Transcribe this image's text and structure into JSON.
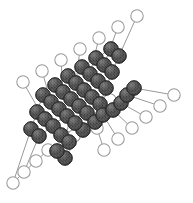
{
  "figure": {
    "type": "ball-and-stick-lattice",
    "width": 193,
    "height": 203,
    "background_color": "#ffffff",
    "atom_types": [
      {
        "id": "dark",
        "label": "filled-sphere-atom",
        "fill_color": "#474747",
        "stroke_color": "#2a2a2a",
        "radius": 7.2,
        "texture": "stippled"
      },
      {
        "id": "open",
        "label": "open-circle-atom",
        "fill_color": "#ffffff",
        "stroke_color": "#9a9a9a",
        "radius": 6.2,
        "texture": "none"
      }
    ],
    "bond_color": "#8d8d8d",
    "bond_width": 0.9
  },
  "chart_data": {
    "type": "scatter",
    "xlabel": "",
    "ylabel": "",
    "xlim": [
      0,
      193
    ],
    "ylim": [
      0,
      203
    ],
    "grid": false,
    "legend": "none",
    "series": [
      {
        "name": "dark",
        "points": [
          [
            111,
            49
          ],
          [
            119,
            56
          ],
          [
            96,
            58
          ],
          [
            104,
            65
          ],
          [
            112,
            72
          ],
          [
            82,
            67
          ],
          [
            90,
            74
          ],
          [
            98,
            81
          ],
          [
            106,
            88
          ],
          [
            68,
            76
          ],
          [
            76,
            83
          ],
          [
            84,
            90
          ],
          [
            92,
            97
          ],
          [
            100,
            104
          ],
          [
            55,
            85
          ],
          [
            63,
            92
          ],
          [
            71,
            99
          ],
          [
            79,
            106
          ],
          [
            87,
            113
          ],
          [
            43,
            95
          ],
          [
            51,
            102
          ],
          [
            59,
            109
          ],
          [
            67,
            116
          ],
          [
            37,
            112
          ],
          [
            45,
            119
          ],
          [
            53,
            126
          ],
          [
            31,
            129
          ],
          [
            39,
            136
          ],
          [
            61,
            135
          ],
          [
            69,
            142
          ],
          [
            83,
            130
          ],
          [
            75,
            123
          ],
          [
            95,
            122
          ],
          [
            103,
            115
          ],
          [
            113,
            110
          ],
          [
            121,
            103
          ],
          [
            127,
            95
          ],
          [
            134,
            88
          ],
          [
            65,
            158
          ],
          [
            57,
            151
          ]
        ]
      },
      {
        "name": "open",
        "points": [
          [
            137,
            16
          ],
          [
            118,
            27
          ],
          [
            99,
            38
          ],
          [
            80,
            49
          ],
          [
            61,
            60
          ],
          [
            42,
            71
          ],
          [
            23,
            82
          ],
          [
            174,
            95
          ],
          [
            160,
            106
          ],
          [
            146,
            117
          ],
          [
            132,
            128
          ],
          [
            118,
            139
          ],
          [
            104,
            150
          ],
          [
            85,
            118
          ],
          [
            97,
            128
          ],
          [
            62,
            126
          ],
          [
            74,
            136
          ],
          [
            48,
            150
          ],
          [
            36,
            161
          ],
          [
            24,
            172
          ],
          [
            13,
            183
          ],
          [
            110,
            100
          ]
        ]
      }
    ],
    "bonds": [
      [
        [
          137,
          16
        ],
        [
          119,
          56
        ]
      ],
      [
        [
          118,
          27
        ],
        [
          104,
          65
        ]
      ],
      [
        [
          99,
          38
        ],
        [
          90,
          74
        ]
      ],
      [
        [
          80,
          49
        ],
        [
          76,
          83
        ]
      ],
      [
        [
          61,
          60
        ],
        [
          63,
          92
        ]
      ],
      [
        [
          42,
          71
        ],
        [
          51,
          102
        ]
      ],
      [
        [
          23,
          82
        ],
        [
          39,
          110
        ]
      ],
      [
        [
          111,
          49
        ],
        [
          119,
          56
        ]
      ],
      [
        [
          96,
          58
        ],
        [
          104,
          65
        ]
      ],
      [
        [
          104,
          65
        ],
        [
          112,
          72
        ]
      ],
      [
        [
          82,
          67
        ],
        [
          90,
          74
        ]
      ],
      [
        [
          90,
          74
        ],
        [
          98,
          81
        ]
      ],
      [
        [
          98,
          81
        ],
        [
          106,
          88
        ]
      ],
      [
        [
          68,
          76
        ],
        [
          76,
          83
        ]
      ],
      [
        [
          76,
          83
        ],
        [
          84,
          90
        ]
      ],
      [
        [
          84,
          90
        ],
        [
          92,
          97
        ]
      ],
      [
        [
          92,
          97
        ],
        [
          100,
          104
        ]
      ],
      [
        [
          55,
          85
        ],
        [
          63,
          92
        ]
      ],
      [
        [
          63,
          92
        ],
        [
          71,
          99
        ]
      ],
      [
        [
          71,
          99
        ],
        [
          79,
          106
        ]
      ],
      [
        [
          79,
          106
        ],
        [
          87,
          113
        ]
      ],
      [
        [
          43,
          95
        ],
        [
          51,
          102
        ]
      ],
      [
        [
          51,
          102
        ],
        [
          59,
          109
        ]
      ],
      [
        [
          59,
          109
        ],
        [
          67,
          116
        ]
      ],
      [
        [
          37,
          112
        ],
        [
          45,
          119
        ]
      ],
      [
        [
          45,
          119
        ],
        [
          53,
          126
        ]
      ],
      [
        [
          31,
          129
        ],
        [
          39,
          136
        ]
      ],
      [
        [
          61,
          135
        ],
        [
          69,
          142
        ]
      ],
      [
        [
          75,
          123
        ],
        [
          83,
          130
        ]
      ],
      [
        [
          95,
          122
        ],
        [
          103,
          115
        ]
      ],
      [
        [
          113,
          110
        ],
        [
          121,
          103
        ]
      ],
      [
        [
          127,
          95
        ],
        [
          134,
          88
        ]
      ],
      [
        [
          57,
          151
        ],
        [
          65,
          158
        ]
      ],
      [
        [
          134,
          88
        ],
        [
          174,
          95
        ]
      ],
      [
        [
          127,
          95
        ],
        [
          160,
          106
        ]
      ],
      [
        [
          121,
          103
        ],
        [
          146,
          117
        ]
      ],
      [
        [
          113,
          110
        ],
        [
          132,
          128
        ]
      ],
      [
        [
          103,
          115
        ],
        [
          118,
          139
        ]
      ],
      [
        [
          95,
          122
        ],
        [
          104,
          150
        ]
      ],
      [
        [
          111,
          49
        ],
        [
          96,
          58
        ]
      ],
      [
        [
          96,
          58
        ],
        [
          82,
          67
        ]
      ],
      [
        [
          82,
          67
        ],
        [
          68,
          76
        ]
      ],
      [
        [
          68,
          76
        ],
        [
          55,
          85
        ]
      ],
      [
        [
          55,
          85
        ],
        [
          43,
          95
        ]
      ],
      [
        [
          43,
          95
        ],
        [
          37,
          112
        ]
      ],
      [
        [
          37,
          112
        ],
        [
          31,
          129
        ]
      ],
      [
        [
          119,
          56
        ],
        [
          112,
          72
        ]
      ],
      [
        [
          112,
          72
        ],
        [
          106,
          88
        ]
      ],
      [
        [
          106,
          88
        ],
        [
          100,
          104
        ]
      ],
      [
        [
          100,
          104
        ],
        [
          87,
          113
        ]
      ],
      [
        [
          87,
          113
        ],
        [
          69,
          142
        ]
      ],
      [
        [
          67,
          116
        ],
        [
          53,
          126
        ]
      ],
      [
        [
          53,
          126
        ],
        [
          39,
          136
        ]
      ],
      [
        [
          39,
          136
        ],
        [
          24,
          172
        ]
      ],
      [
        [
          31,
          129
        ],
        [
          13,
          183
        ]
      ],
      [
        [
          36,
          161
        ],
        [
          48,
          150
        ]
      ],
      [
        [
          24,
          172
        ],
        [
          36,
          161
        ]
      ],
      [
        [
          13,
          183
        ],
        [
          24,
          172
        ]
      ],
      [
        [
          65,
          158
        ],
        [
          83,
          130
        ]
      ],
      [
        [
          85,
          118
        ],
        [
          97,
          128
        ]
      ],
      [
        [
          62,
          126
        ],
        [
          74,
          136
        ]
      ],
      [
        [
          110,
          100
        ],
        [
          121,
          103
        ]
      ]
    ]
  }
}
